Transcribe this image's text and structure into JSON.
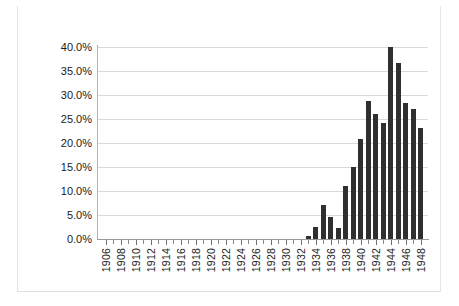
{
  "chart_data": {
    "type": "bar",
    "title": "",
    "subtitle": "",
    "xlabel": "",
    "ylabel": "",
    "grid": true,
    "legend": null,
    "ylim": [
      0,
      40
    ],
    "ytick_format": "percent",
    "yticks": [
      0,
      5,
      10,
      15,
      20,
      25,
      30,
      35,
      40
    ],
    "ytick_labels": [
      "0.0%",
      "5.0%",
      "10.0%",
      "15.0%",
      "20.0%",
      "25.0%",
      "30.0%",
      "35.0%",
      "40.0%"
    ],
    "xlim": [
      1905,
      1949
    ],
    "xtick_labels": [
      "1906",
      "1908",
      "1910",
      "1912",
      "1914",
      "1916",
      "1918",
      "1920",
      "1922",
      "1924",
      "1926",
      "1928",
      "1930",
      "1932",
      "1934",
      "1936",
      "1938",
      "1940",
      "1942",
      "1944",
      "1946",
      "1948"
    ],
    "xtick_label_years": [
      1906,
      1908,
      1910,
      1912,
      1914,
      1916,
      1918,
      1920,
      1922,
      1924,
      1926,
      1928,
      1930,
      1932,
      1934,
      1936,
      1938,
      1940,
      1942,
      1944,
      1946,
      1948
    ],
    "categories": [
      1906,
      1907,
      1908,
      1909,
      1910,
      1911,
      1912,
      1913,
      1914,
      1915,
      1916,
      1917,
      1918,
      1919,
      1920,
      1921,
      1922,
      1923,
      1924,
      1925,
      1926,
      1927,
      1928,
      1929,
      1930,
      1931,
      1932,
      1933,
      1934,
      1935,
      1936,
      1937,
      1938,
      1939,
      1940,
      1941,
      1942,
      1943,
      1944,
      1945,
      1946,
      1947,
      1948
    ],
    "values": [
      0,
      0,
      0,
      0,
      0,
      0,
      0,
      0,
      0,
      0,
      0,
      0,
      0,
      0,
      0,
      0,
      0,
      0,
      0,
      0,
      0,
      0,
      0,
      0,
      0,
      0,
      0,
      0.7,
      2.6,
      7.1,
      4.6,
      2.2,
      11.0,
      14.9,
      20.9,
      28.7,
      26.0,
      24.2,
      40.0,
      36.6,
      28.4,
      27.1,
      23.1
    ],
    "bar_color": "#2f2f2f",
    "gridline_color": "#d9d9d9",
    "axis_color": "#8a8a8a"
  }
}
